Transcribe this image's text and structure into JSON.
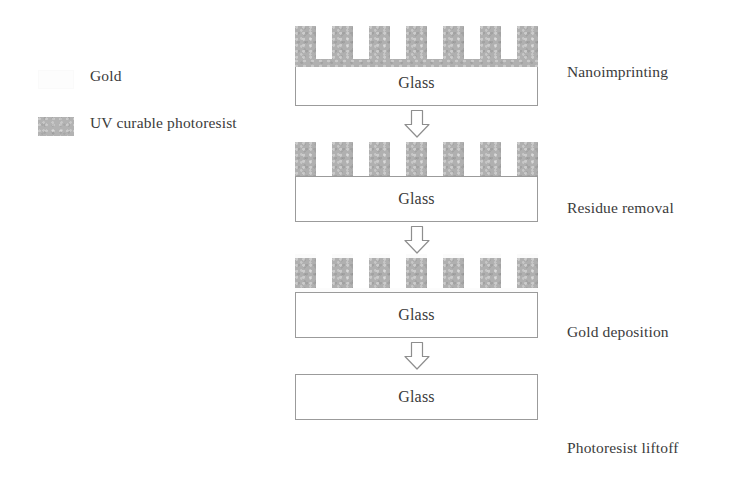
{
  "figure": {
    "kind": "process-flow-diagram"
  },
  "legend": {
    "items": [
      {
        "id": "gold",
        "label": "Gold",
        "color": "#fdfdfd",
        "swatch_name": "gold-swatch"
      },
      {
        "id": "photoresist",
        "label": "UV curable photoresist",
        "color": "#b0b0b0",
        "swatch_name": "photoresist-swatch"
      }
    ]
  },
  "substrate": {
    "label": "Glass",
    "fill": "#ffffff",
    "border": "#9b9b9b"
  },
  "arrow": {
    "direction": "down",
    "style": "hollow-block",
    "stroke": "#8e8e8e",
    "fill": "#ffffff"
  },
  "stages": [
    {
      "id": "nanoimprinting",
      "label": "Nanoimprinting",
      "substrate_label": "Glass",
      "pillar_count": 7,
      "has_residual_layer": true,
      "has_gold": false
    },
    {
      "id": "residue-removal",
      "label": "Residue removal",
      "substrate_label": "Glass",
      "pillar_count": 7,
      "has_residual_layer": false,
      "has_gold": false
    },
    {
      "id": "gold-deposition",
      "label": "Gold deposition",
      "substrate_label": "Glass",
      "pillar_count": 7,
      "has_residual_layer": false,
      "has_gold": true
    },
    {
      "id": "photoresist-liftoff",
      "label": "Photoresist liftoff",
      "substrate_label": "Glass",
      "pillar_count": 0,
      "has_residual_layer": false,
      "has_gold": false
    }
  ]
}
